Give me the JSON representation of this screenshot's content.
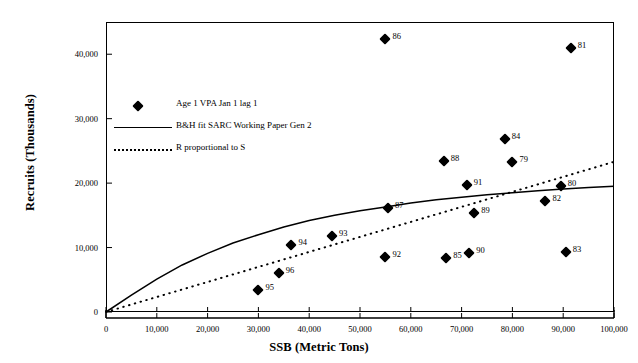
{
  "chart_data": {
    "type": "scatter",
    "title": "",
    "xlabel": "SSB (Metric Tons)",
    "ylabel": "Recruits (Thousands)",
    "xlim": [
      0,
      100000
    ],
    "ylim": [
      0,
      45000
    ],
    "grid": false,
    "legend_position": "upper-left-inside",
    "xticks": [
      "0",
      "10,000",
      "20,000",
      "30,000",
      "40,000",
      "50,000",
      "60,000",
      "70,000",
      "80,000",
      "90,000",
      "100,000"
    ],
    "xtick_values": [
      0,
      10000,
      20000,
      30000,
      40000,
      50000,
      60000,
      70000,
      80000,
      90000,
      100000
    ],
    "yticks": [
      "0",
      "10,000",
      "20,000",
      "30,000",
      "40,000"
    ],
    "ytick_values": [
      0,
      10000,
      20000,
      30000,
      40000
    ],
    "legend": [
      {
        "label": "Age 1 VPA Jan 1 lag 1",
        "marker": "diamond",
        "style": "marker"
      },
      {
        "label": "B&H fit SARC Working Paper Gen 2",
        "marker": "line",
        "style": "solid"
      },
      {
        "label": "R proportional to S",
        "marker": "line",
        "style": "dotted"
      }
    ],
    "series": [
      {
        "name": "Age 1 VPA Jan 1 lag 1",
        "marker": "diamond",
        "points": [
          {
            "label": "95",
            "x": 30000,
            "y": 3400
          },
          {
            "label": "96",
            "x": 34000,
            "y": 6100
          },
          {
            "label": "94",
            "x": 36500,
            "y": 10400
          },
          {
            "label": "93",
            "x": 44500,
            "y": 11800
          },
          {
            "label": "92",
            "x": 55000,
            "y": 8500
          },
          {
            "label": "87",
            "x": 55500,
            "y": 16200
          },
          {
            "label": "86",
            "x": 55000,
            "y": 42300
          },
          {
            "label": "88",
            "x": 66500,
            "y": 23500
          },
          {
            "label": "85",
            "x": 67000,
            "y": 8400
          },
          {
            "label": "90",
            "x": 71500,
            "y": 9100
          },
          {
            "label": "91",
            "x": 71000,
            "y": 19700
          },
          {
            "label": "89",
            "x": 72500,
            "y": 15300
          },
          {
            "label": "84",
            "x": 78500,
            "y": 26800
          },
          {
            "label": "79",
            "x": 80000,
            "y": 23200
          },
          {
            "label": "82",
            "x": 86500,
            "y": 17200
          },
          {
            "label": "80",
            "x": 89500,
            "y": 19600
          },
          {
            "label": "83",
            "x": 90500,
            "y": 9300
          },
          {
            "label": "81",
            "x": 91500,
            "y": 41000
          }
        ]
      }
    ],
    "curves": [
      {
        "name": "B&H fit SARC Working Paper Gen 2",
        "style": "solid",
        "points": [
          {
            "x": 0,
            "y": 0
          },
          {
            "x": 5000,
            "y": 2600
          },
          {
            "x": 10000,
            "y": 5100
          },
          {
            "x": 15000,
            "y": 7300
          },
          {
            "x": 20000,
            "y": 9100
          },
          {
            "x": 25000,
            "y": 10700
          },
          {
            "x": 30000,
            "y": 12000
          },
          {
            "x": 35000,
            "y": 13200
          },
          {
            "x": 40000,
            "y": 14200
          },
          {
            "x": 45000,
            "y": 15000
          },
          {
            "x": 50000,
            "y": 15700
          },
          {
            "x": 55000,
            "y": 16300
          },
          {
            "x": 60000,
            "y": 16900
          },
          {
            "x": 65000,
            "y": 17400
          },
          {
            "x": 70000,
            "y": 17800
          },
          {
            "x": 75000,
            "y": 18200
          },
          {
            "x": 80000,
            "y": 18500
          },
          {
            "x": 85000,
            "y": 18800
          },
          {
            "x": 90000,
            "y": 19100
          },
          {
            "x": 95000,
            "y": 19300
          },
          {
            "x": 100000,
            "y": 19500
          }
        ]
      },
      {
        "name": "R proportional to S",
        "style": "dotted",
        "points": [
          {
            "x": 0,
            "y": 0
          },
          {
            "x": 100000,
            "y": 23300
          }
        ]
      }
    ]
  }
}
